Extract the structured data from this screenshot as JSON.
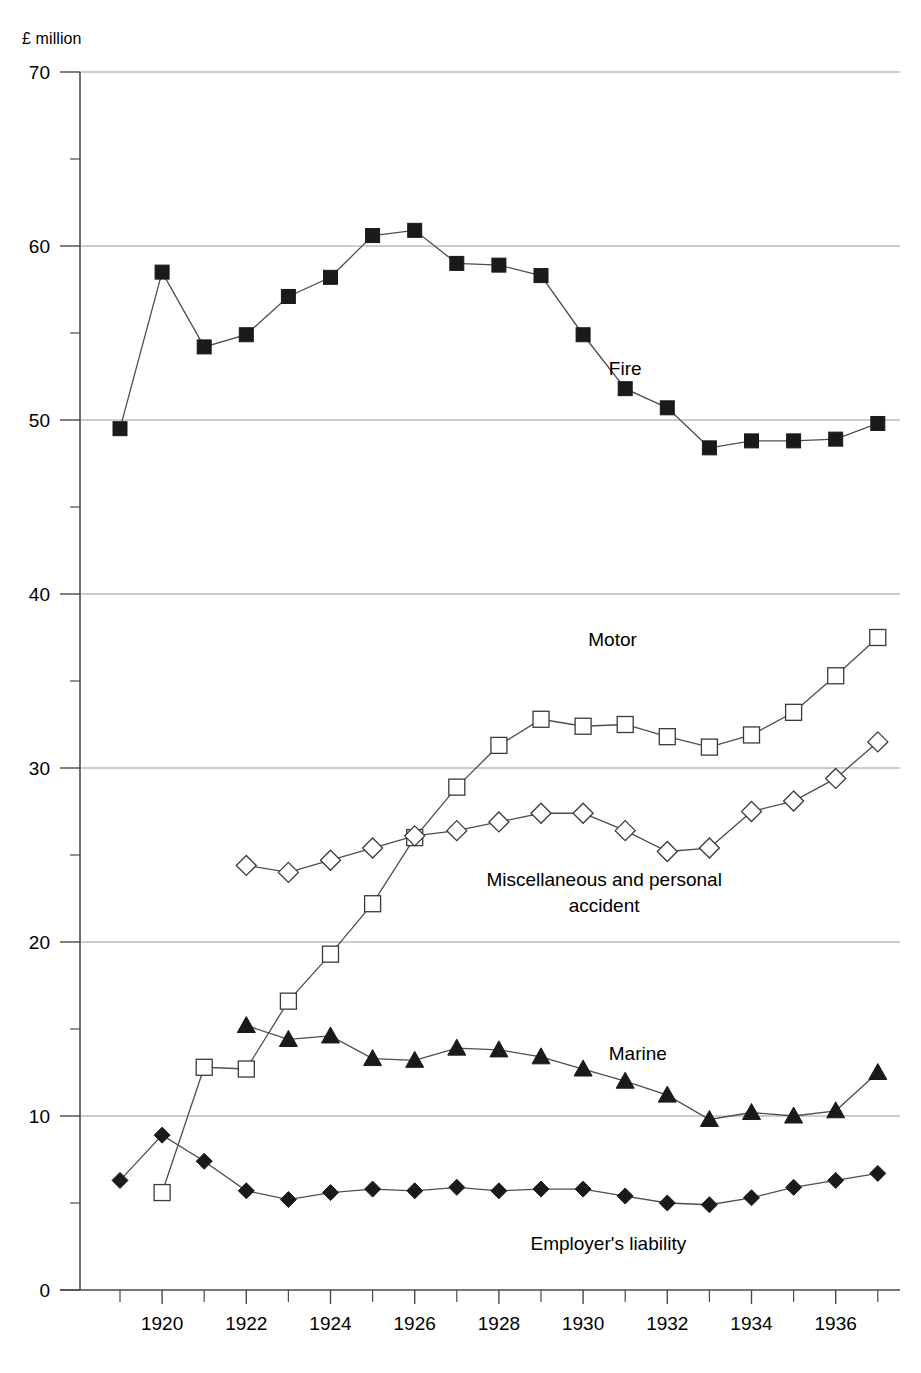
{
  "chart_data": {
    "type": "line",
    "title": "",
    "subtitle": "",
    "xlabel": "",
    "ylabel": "£ million",
    "y_unit_label": "£ million",
    "xlim": [
      1919,
      1937
    ],
    "ylim": [
      0,
      70
    ],
    "y_ticks_major": [
      0,
      10,
      20,
      30,
      40,
      50,
      60,
      70
    ],
    "y_ticks_minor": [
      5,
      15,
      25,
      35,
      45,
      55,
      65
    ],
    "x_ticks_major": [
      1920,
      1922,
      1924,
      1926,
      1928,
      1930,
      1932,
      1934,
      1936
    ],
    "x_ticks_all": [
      1919,
      1920,
      1921,
      1922,
      1923,
      1924,
      1925,
      1926,
      1927,
      1928,
      1929,
      1930,
      1931,
      1932,
      1933,
      1934,
      1935,
      1936,
      1937
    ],
    "x_tick_labels": [
      "1920",
      "1922",
      "1924",
      "1926",
      "1928",
      "1930",
      "1932",
      "1934",
      "1936"
    ],
    "y_tick_labels": [
      "0",
      "10",
      "20",
      "30",
      "40",
      "50",
      "60",
      "70"
    ],
    "grid": "horizontal-major",
    "legend_position": "inline-annotations",
    "series": [
      {
        "name": "Fire",
        "marker": "filled-square",
        "label_x": 1931.0,
        "label_y": 52.6,
        "x": [
          1919,
          1920,
          1921,
          1922,
          1923,
          1924,
          1925,
          1926,
          1927,
          1928,
          1929,
          1930,
          1931,
          1932,
          1933,
          1934,
          1935,
          1936,
          1937
        ],
        "values": [
          49.5,
          58.5,
          54.2,
          54.9,
          57.1,
          58.2,
          60.6,
          60.9,
          59.0,
          58.9,
          58.3,
          54.9,
          51.8,
          50.7,
          48.4,
          48.8,
          48.8,
          48.9,
          49.8
        ]
      },
      {
        "name": "Motor",
        "marker": "open-square",
        "label_x": 1930.7,
        "label_y": 37.0,
        "x": [
          1920,
          1921,
          1922,
          1923,
          1924,
          1925,
          1926,
          1927,
          1928,
          1929,
          1930,
          1931,
          1932,
          1933,
          1934,
          1935,
          1936,
          1937
        ],
        "values": [
          5.6,
          12.8,
          12.7,
          16.6,
          19.3,
          22.2,
          26.0,
          28.9,
          31.3,
          32.8,
          32.4,
          32.5,
          31.8,
          31.2,
          31.9,
          33.2,
          35.3,
          37.5
        ]
      },
      {
        "name": "Miscellaneous and personal accident",
        "marker": "open-diamond",
        "label_x": 1930.5,
        "label_y": 23.2,
        "label_line2": "accident",
        "x": [
          1922,
          1923,
          1924,
          1925,
          1926,
          1927,
          1928,
          1929,
          1930,
          1931,
          1932,
          1933,
          1934,
          1935,
          1936,
          1937
        ],
        "values": [
          24.4,
          24.0,
          24.7,
          25.4,
          26.1,
          26.4,
          26.9,
          27.4,
          27.4,
          26.4,
          25.2,
          25.4,
          27.5,
          28.1,
          29.4,
          31.5
        ]
      },
      {
        "name": "Marine",
        "marker": "filled-triangle",
        "label_x": 1931.3,
        "label_y": 13.2,
        "x": [
          1922,
          1923,
          1924,
          1925,
          1926,
          1927,
          1928,
          1929,
          1930,
          1931,
          1932,
          1933,
          1934,
          1935,
          1936,
          1937
        ],
        "values": [
          15.2,
          14.4,
          14.6,
          13.3,
          13.2,
          13.9,
          13.8,
          13.4,
          12.7,
          12.0,
          11.2,
          9.8,
          10.2,
          10.0,
          10.3,
          12.5
        ]
      },
      {
        "name": "Employer's liability",
        "marker": "filled-diamond",
        "label_x": 1930.6,
        "label_y": 2.3,
        "x": [
          1919,
          1920,
          1921,
          1922,
          1923,
          1924,
          1925,
          1926,
          1927,
          1928,
          1929,
          1930,
          1931,
          1932,
          1933,
          1934,
          1935,
          1936,
          1937
        ],
        "values": [
          6.3,
          8.9,
          7.4,
          5.7,
          5.2,
          5.6,
          5.8,
          5.7,
          5.9,
          5.7,
          5.8,
          5.8,
          5.4,
          5.0,
          4.9,
          5.3,
          5.9,
          6.3,
          6.7
        ]
      }
    ]
  },
  "labels": {
    "fire": "Fire",
    "motor": "Motor",
    "misc_line1": "Miscellaneous and personal",
    "misc_line2": "accident",
    "marine": "Marine",
    "employers": "Employer's liability",
    "unit": "£ million"
  },
  "colors": {
    "ink": "#000000",
    "grid": "#9a9a9a",
    "line": "#4d4d4d",
    "marker_fill": "#1a1a1a",
    "marker_open_fill": "#ffffff",
    "background": "#ffffff"
  }
}
